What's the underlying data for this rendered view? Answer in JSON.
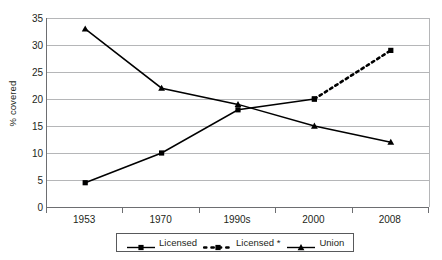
{
  "chart_data": {
    "type": "line",
    "title": "",
    "xlabel": "",
    "ylabel": "% covered",
    "categories": [
      "1953",
      "1970",
      "1990s",
      "2000",
      "2008"
    ],
    "ylim": [
      0,
      35
    ],
    "yticks": [
      0,
      5,
      10,
      15,
      20,
      25,
      30,
      35
    ],
    "grid": true,
    "legend_position": "bottom",
    "series": [
      {
        "name": "Licensed",
        "style": "solid",
        "marker": "square",
        "color": "#000000",
        "values": [
          4.5,
          10,
          18,
          20,
          null
        ]
      },
      {
        "name": "Licensed *",
        "style": "dashed",
        "marker": "square",
        "color": "#000000",
        "values": [
          null,
          null,
          null,
          20,
          29
        ]
      },
      {
        "name": "Union",
        "style": "solid",
        "marker": "triangle",
        "color": "#000000",
        "values": [
          33,
          22,
          19,
          15,
          12
        ]
      }
    ]
  },
  "axis": {
    "y_title": "% covered",
    "y_tick_labels": [
      "0",
      "5",
      "10",
      "15",
      "20",
      "25",
      "30",
      "35"
    ],
    "x_tick_labels": [
      "1953",
      "1970",
      "1990s",
      "2000",
      "2008"
    ]
  },
  "legend": {
    "entries": [
      {
        "label": "Licensed"
      },
      {
        "label": "Licensed *"
      },
      {
        "label": "Union"
      }
    ]
  },
  "colors": {
    "series": "#000000",
    "gridline": "#b5b6b8",
    "axis": "#6d6e71",
    "text": "#231f20",
    "background": "#ffffff"
  }
}
